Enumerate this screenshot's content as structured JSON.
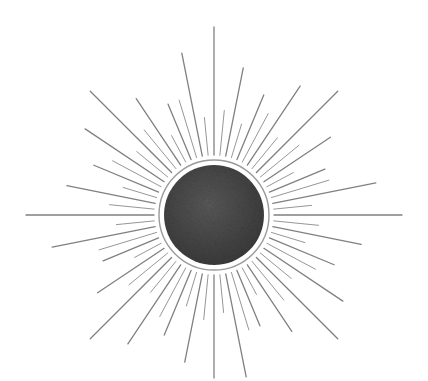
{
  "image": {
    "subject": "pencil-drawn sunburst with dark textured circle",
    "background": "#ffffff",
    "center": [
      214,
      215
    ],
    "disc_radius": 50,
    "ring_radius": 55,
    "disc_color": "#4a4a4a",
    "ray_color": "#6a6a6a",
    "ray_count": 64,
    "ray_start": 60,
    "ray_lengths_long": [
      188,
      150,
      130,
      155,
      175,
      140,
      120,
      165
    ],
    "ray_lengths_short": [
      105,
      95,
      115,
      100,
      110,
      90,
      120,
      98
    ]
  }
}
